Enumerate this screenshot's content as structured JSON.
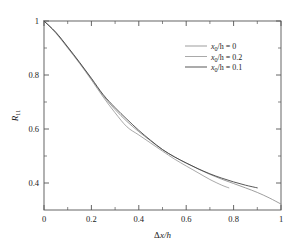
{
  "chart_data": {
    "type": "line",
    "title": "",
    "xlabel": "Δx/h",
    "ylabel": "R11",
    "xlim": [
      0,
      1
    ],
    "ylim": [
      0.3,
      1.0
    ],
    "grid": false,
    "legend_position": "top-right",
    "x_ticks": [
      "0",
      "0.2",
      "0.4",
      "0.6",
      "0.8",
      "1"
    ],
    "x_tick_values": [
      0,
      0.2,
      0.4,
      0.6,
      0.8,
      1
    ],
    "x_minor_ticks": [
      0.1,
      0.3,
      0.5,
      0.7,
      0.9
    ],
    "y_ticks": [
      "0.4",
      "0.6",
      "0.8",
      "1"
    ],
    "y_tick_values": [
      0.4,
      0.6,
      0.8,
      1.0
    ],
    "y_minor_ticks": [
      0.5,
      0.7,
      0.9
    ],
    "series": [
      {
        "name": "x0/h = 0",
        "color": "#8c8c8c",
        "x": [
          0.0,
          0.05,
          0.1,
          0.15,
          0.2,
          0.25,
          0.3,
          0.35,
          0.4,
          0.45,
          0.5,
          0.55,
          0.6,
          0.65,
          0.7,
          0.75,
          0.8,
          0.85,
          0.9,
          0.95,
          1.0
        ],
        "values": [
          1.0,
          0.957,
          0.902,
          0.845,
          0.785,
          0.723,
          0.672,
          0.628,
          0.59,
          0.556,
          0.523,
          0.497,
          0.474,
          0.452,
          0.432,
          0.414,
          0.398,
          0.382,
          0.365,
          0.345,
          0.322
        ]
      },
      {
        "name": "x0/h = 0.2",
        "color": "#9a9a9a",
        "x": [
          0.0,
          0.05,
          0.1,
          0.15,
          0.2,
          0.25,
          0.3,
          0.35,
          0.4,
          0.45,
          0.5,
          0.55,
          0.6,
          0.65,
          0.7,
          0.75,
          0.78
        ],
        "values": [
          1.0,
          0.955,
          0.9,
          0.843,
          0.782,
          0.718,
          0.66,
          0.608,
          0.578,
          0.548,
          0.518,
          0.489,
          0.463,
          0.438,
          0.413,
          0.392,
          0.382
        ]
      },
      {
        "name": "x0/h = 0.1",
        "color": "#3a3a3a",
        "x": [
          0.0,
          0.05,
          0.1,
          0.15,
          0.2,
          0.25,
          0.3,
          0.35,
          0.4,
          0.45,
          0.5,
          0.55,
          0.6,
          0.65,
          0.7,
          0.75,
          0.8,
          0.85,
          0.9
        ],
        "values": [
          1.0,
          0.958,
          0.904,
          0.847,
          0.788,
          0.727,
          0.679,
          0.636,
          0.595,
          0.558,
          0.524,
          0.497,
          0.474,
          0.453,
          0.434,
          0.418,
          0.404,
          0.392,
          0.382
        ]
      }
    ],
    "legend": [
      {
        "label_main": "x",
        "label_sub": "0",
        "label_rest": "/h = 0",
        "color": "#8c8c8c"
      },
      {
        "label_main": "x",
        "label_sub": "0",
        "label_rest": "/h = 0.2",
        "color": "#9a9a9a"
      },
      {
        "label_main": "x",
        "label_sub": "0",
        "label_rest": "/h = 0.1",
        "color": "#3a3a3a"
      }
    ],
    "ylabel_main": "R",
    "ylabel_sub": "11",
    "xlabel_delta": "Δ",
    "xlabel_x": "x",
    "xlabel_rest": "/h"
  },
  "colors": {
    "axis": "#555555",
    "text": "#1a1a1a",
    "background": "#ffffff"
  }
}
